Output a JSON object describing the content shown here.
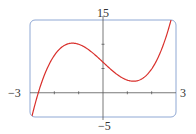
{
  "chart_data": {
    "type": "line",
    "title": "",
    "xlabel": "",
    "ylabel": "",
    "xlim": [
      -3,
      3
    ],
    "ylim": [
      -5,
      15
    ],
    "x_ticks": [
      -2,
      -1,
      1,
      2
    ],
    "y_ticks": [
      5,
      10
    ],
    "tick_labels": {
      "x_min": "−3",
      "x_max": "3",
      "y_min": "−5",
      "y_max": "15"
    },
    "grid": false,
    "legend": null,
    "series": [
      {
        "name": "f(x)",
        "color": "#d9302c",
        "x": [
          -3,
          -2.75,
          -2.5,
          -2.25,
          -2,
          -1.75,
          -1.5,
          -1.25,
          -1,
          -0.75,
          -0.5,
          -0.25,
          0,
          0.25,
          0.5,
          0.75,
          1,
          1.25,
          1.5,
          1.75,
          2,
          2.25,
          2.5,
          2.75,
          3
        ],
        "y": [
          -6.6,
          -1.5,
          2.4,
          5.4,
          7.7,
          9.1,
          10.0,
          10.2,
          10.0,
          9.4,
          8.5,
          7.5,
          6.3,
          5.1,
          4.1,
          3.2,
          2.6,
          2.4,
          2.6,
          3.4,
          4.9,
          7.1,
          10.2,
          14.2,
          19.2
        ]
      }
    ],
    "colors": {
      "frame": "#8fa8d4",
      "axis": "#555555",
      "curve": "#d9302c"
    }
  }
}
